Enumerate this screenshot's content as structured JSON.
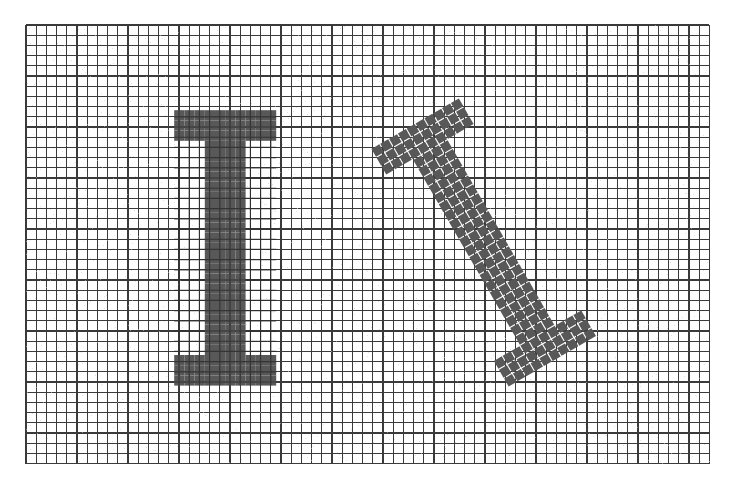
{
  "figure": {
    "background_color": "#ffffff",
    "grid": {
      "name": "sampling-grid",
      "origin_x": 26,
      "origin_y": 25,
      "cell_size": 10.2,
      "cols": 67,
      "rows": 43,
      "line_color": "#3a3a3a",
      "line_width": 1.15,
      "fill_color": "#ffffff",
      "noise": true
    },
    "shapes": [
      {
        "name": "upright-letter-i",
        "label": "I",
        "rotation_deg": 0,
        "fill_color": "#585858",
        "pixel_size": 10.2,
        "origin_x": 174.2,
        "origin_y": 110.2,
        "glyph_cols": 10,
        "glyph_rows": 27,
        "pixel_map": [
          "1111111111",
          "1111111111",
          "1111111111",
          "0001111000",
          "0001111000",
          "0001111000",
          "0001111000",
          "0001111000",
          "0001111000",
          "0001111000",
          "0001111000",
          "0001111000",
          "0001111000",
          "0001111000",
          "0001111000",
          "0001111000",
          "0001111000",
          "0001111000",
          "0001111000",
          "0001111000",
          "0001111000",
          "0001111000",
          "0001111000",
          "0001111000",
          "1111111111",
          "1111111111",
          "1111111111"
        ]
      },
      {
        "name": "rotated-letter-i",
        "label": "I",
        "rotation_deg": -30,
        "fill_color": "#585858",
        "pixel_size": 10.2,
        "pixel_gap": 1.1,
        "pivot_x": 483,
        "pivot_y": 243,
        "origin_x": 432.9,
        "origin_y": 105.2,
        "glyph_cols": 10,
        "glyph_rows": 27,
        "pixel_map": [
          "1111111111",
          "1111111111",
          "1111111111",
          "0001111000",
          "0001111000",
          "0001111000",
          "0001111000",
          "0001111000",
          "0001111000",
          "0001111000",
          "0001111000",
          "0001111000",
          "0001111000",
          "0001111000",
          "0001111000",
          "0001111000",
          "0001111000",
          "0001111000",
          "0001111000",
          "0001111000",
          "0001111000",
          "0001111000",
          "0001111000",
          "0001111000",
          "1111111111",
          "1111111111",
          "1111111111"
        ]
      }
    ]
  }
}
